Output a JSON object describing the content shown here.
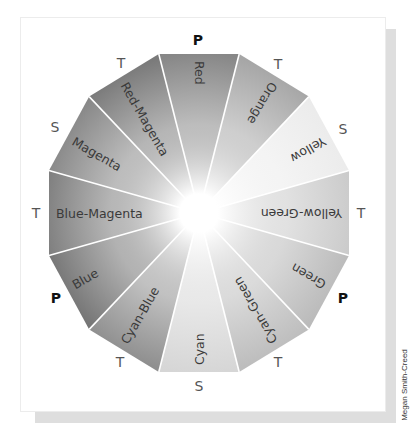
{
  "diagram": {
    "center": [
      199,
      213
    ],
    "radius_x": 155.3,
    "radius_y": 164.6,
    "center_color": "#ffffff",
    "separator_color": "#ffffff",
    "label_color": "#3a3a3a",
    "marker_color": "#555555",
    "segments": [
      {
        "label": "Red",
        "angle": -90,
        "color": "#878787"
      },
      {
        "label": "Orange",
        "angle": -60,
        "color": "#a6a6a6"
      },
      {
        "label": "Yellow",
        "angle": -30,
        "color": "#ebebeb"
      },
      {
        "label": "Yellow-Green",
        "angle": 0,
        "color": "#c9c9c9"
      },
      {
        "label": "Green",
        "angle": 30,
        "color": "#b9b9b9"
      },
      {
        "label": "Cyan-Green",
        "angle": 60,
        "color": "#bdbdbd"
      },
      {
        "label": "Cyan",
        "angle": 90,
        "color": "#d6d6d6"
      },
      {
        "label": "Cyan-Blue",
        "angle": 120,
        "color": "#8f8f8f"
      },
      {
        "label": "Blue",
        "angle": 150,
        "color": "#737373"
      },
      {
        "label": "Blue-Magenta",
        "angle": 180,
        "color": "#7b7b7b"
      },
      {
        "label": "Magenta",
        "angle": 210,
        "color": "#868686"
      },
      {
        "label": "Red-Magenta",
        "angle": 240,
        "color": "#7a7a7a"
      }
    ],
    "markers": [
      {
        "text": "P",
        "x": 198,
        "y": 40,
        "bold": true
      },
      {
        "text": "T",
        "x": 278,
        "y": 64,
        "bold": false
      },
      {
        "text": "S",
        "x": 343,
        "y": 129,
        "bold": false
      },
      {
        "text": "T",
        "x": 361,
        "y": 213,
        "bold": false
      },
      {
        "text": "P",
        "x": 343,
        "y": 298,
        "bold": true
      },
      {
        "text": "T",
        "x": 278,
        "y": 362,
        "bold": false
      },
      {
        "text": "S",
        "x": 199,
        "y": 386,
        "bold": false
      },
      {
        "text": "T",
        "x": 120,
        "y": 362,
        "bold": false
      },
      {
        "text": "P",
        "x": 56,
        "y": 298,
        "bold": true
      },
      {
        "text": "T",
        "x": 36,
        "y": 213,
        "bold": false
      },
      {
        "text": "S",
        "x": 55,
        "y": 127,
        "bold": false
      },
      {
        "text": "T",
        "x": 121,
        "y": 63,
        "bold": false
      }
    ],
    "legend_meaning": {
      "P": "Primary",
      "S": "Secondary",
      "T": "Tertiary"
    }
  },
  "credit": "Megan Smith-Creed"
}
